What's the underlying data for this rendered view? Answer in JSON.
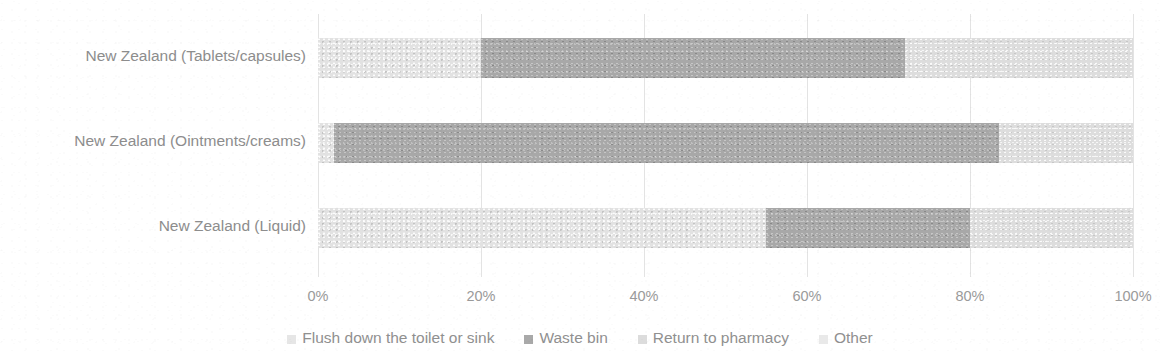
{
  "chart_data": {
    "type": "bar",
    "orientation": "horizontal",
    "stacked": true,
    "normalized_percent": true,
    "title": "",
    "xlabel": "",
    "ylabel": "",
    "xlim": [
      0,
      100
    ],
    "grid": true,
    "legend_position": "bottom",
    "categories": [
      "New Zealand (Tablets/capsules)",
      "New Zealand (Ointments/creams)",
      "New Zealand (Liquid)"
    ],
    "xticks": [
      "0%",
      "20%",
      "40%",
      "60%",
      "80%",
      "100%"
    ],
    "xtick_values": [
      0,
      20,
      40,
      60,
      80,
      100
    ],
    "series": [
      {
        "name": "Flush down the toilet or sink",
        "color": "#e2e2e2",
        "values": [
          20,
          2,
          55
        ]
      },
      {
        "name": "Waste bin",
        "color": "#a8a8a8",
        "values": [
          52,
          81.5,
          25
        ]
      },
      {
        "name": "Return to pharmacy",
        "color": "#dddddd",
        "values": [
          28,
          16.5,
          20
        ]
      },
      {
        "name": "Other",
        "color": "#ebebeb",
        "values": [
          0,
          0,
          0
        ]
      }
    ]
  },
  "legend": {
    "items": [
      {
        "label": "Flush down the toilet or sink",
        "swatch": "flush"
      },
      {
        "label": "Waste bin",
        "swatch": "waste"
      },
      {
        "label": "Return to pharmacy",
        "swatch": "returnp"
      },
      {
        "label": "Other",
        "swatch": "other"
      }
    ]
  }
}
